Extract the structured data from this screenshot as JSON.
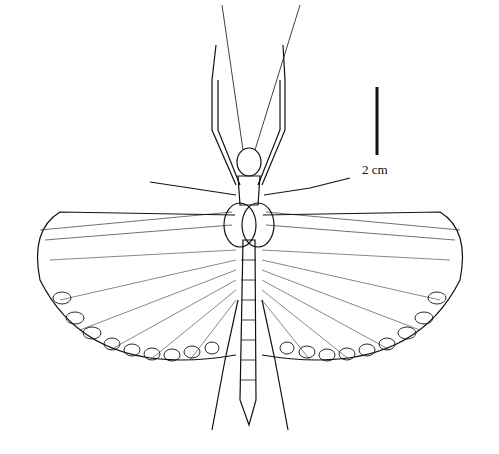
{
  "figure": {
    "scale_bar": {
      "label": "2 cm"
    }
  }
}
